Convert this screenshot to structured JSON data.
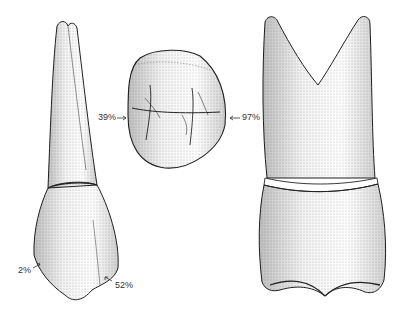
{
  "figure": {
    "views": [
      {
        "name": "proximal-view"
      },
      {
        "name": "occlusal-view"
      },
      {
        "name": "buccal-view"
      }
    ],
    "labels": {
      "occlusal_left": "39%",
      "occlusal_right": "97%",
      "crown_left": "2%",
      "crown_right": "52%"
    },
    "colors": {
      "ink": "#222222",
      "stipple": "#888888",
      "background": "#ffffff"
    }
  }
}
